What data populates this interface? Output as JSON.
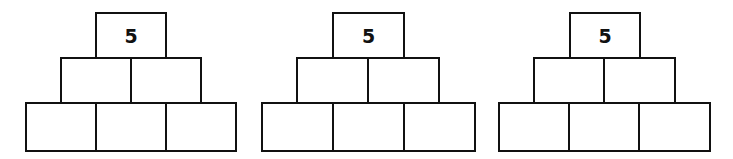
{
  "pyramids": [
    {
      "top": {
        "value": "5",
        "x": 95,
        "y": 12,
        "w": 72,
        "h": 47
      },
      "middle": [
        {
          "value": "",
          "x": 60,
          "y": 57,
          "w": 72,
          "h": 47
        },
        {
          "value": "",
          "x": 130,
          "y": 57,
          "w": 72,
          "h": 47
        }
      ],
      "bottom": [
        {
          "value": "",
          "x": 25,
          "y": 102,
          "w": 72,
          "h": 50
        },
        {
          "value": "",
          "x": 95,
          "y": 102,
          "w": 72,
          "h": 50
        },
        {
          "value": "",
          "x": 165,
          "y": 102,
          "w": 72,
          "h": 50
        }
      ]
    },
    {
      "top": {
        "value": "5",
        "x": 332,
        "y": 12,
        "w": 73,
        "h": 47
      },
      "middle": [
        {
          "value": "",
          "x": 296,
          "y": 57,
          "w": 73,
          "h": 47
        },
        {
          "value": "",
          "x": 367,
          "y": 57,
          "w": 73,
          "h": 47
        }
      ],
      "bottom": [
        {
          "value": "",
          "x": 261,
          "y": 102,
          "w": 73,
          "h": 50
        },
        {
          "value": "",
          "x": 332,
          "y": 102,
          "w": 73,
          "h": 50
        },
        {
          "value": "",
          "x": 403,
          "y": 102,
          "w": 73,
          "h": 50
        }
      ]
    },
    {
      "top": {
        "value": "5",
        "x": 569,
        "y": 12,
        "w": 72,
        "h": 47
      },
      "middle": [
        {
          "value": "",
          "x": 533,
          "y": 57,
          "w": 72,
          "h": 47
        },
        {
          "value": "",
          "x": 603,
          "y": 57,
          "w": 73,
          "h": 47
        }
      ],
      "bottom": [
        {
          "value": "",
          "x": 498,
          "y": 102,
          "w": 72,
          "h": 50
        },
        {
          "value": "",
          "x": 568,
          "y": 102,
          "w": 72,
          "h": 50
        },
        {
          "value": "",
          "x": 638,
          "y": 102,
          "w": 73,
          "h": 50
        }
      ]
    }
  ]
}
